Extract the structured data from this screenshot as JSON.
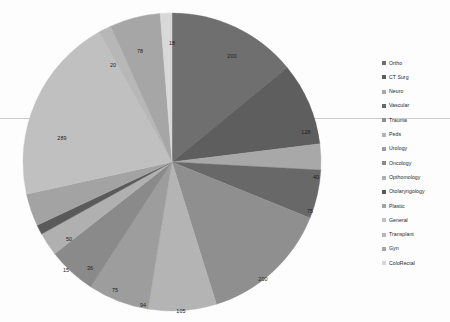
{
  "chart_data": {
    "type": "pie",
    "title": "",
    "xlabel": "",
    "ylabel": "",
    "legend_position": "right",
    "grid": false,
    "start_angle_deg": 0,
    "direction": "clockwise",
    "total": 1423,
    "categories": [
      "Ortho",
      "CT Surg",
      "Neuro",
      "Vascular",
      "Trauma",
      "Peds",
      "Urology",
      "Oncology",
      "Opthomology",
      "Otolaryngology",
      "Plastic",
      "General",
      "Transplant",
      "Gyn",
      "ColoRectal"
    ],
    "values": [
      200,
      128,
      40,
      75,
      200,
      105,
      94,
      75,
      36,
      15,
      50,
      289,
      20,
      78,
      18
    ],
    "data_labels": [
      "200",
      "128",
      "40",
      "75",
      "200",
      "105",
      "94",
      "75",
      "36",
      "15",
      "50",
      "289",
      "20",
      "78",
      "18"
    ],
    "colors": [
      "#6f6f6f",
      "#5e5e5e",
      "#a8a8a8",
      "#686868",
      "#8f8f8f",
      "#b4b4b4",
      "#9d9d9d",
      "#8a8a8a",
      "#b0b0b0",
      "#5a5a5a",
      "#a3a3a3",
      "#c0c0c0",
      "#b7b7b7",
      "#a6a6a6",
      "#d8d8d8"
    ],
    "label_positions": [
      {
        "label": "200",
        "x": 210,
        "y": 45
      },
      {
        "label": "128",
        "x": 284,
        "y": 121
      },
      {
        "label": "40",
        "x": 294,
        "y": 166
      },
      {
        "label": "75",
        "x": 288,
        "y": 200
      },
      {
        "label": "200",
        "x": 241,
        "y": 268
      },
      {
        "label": "105",
        "x": 159,
        "y": 300
      },
      {
        "label": "94",
        "x": 121,
        "y": 294
      },
      {
        "label": "75",
        "x": 93,
        "y": 279
      },
      {
        "label": "36",
        "x": 68,
        "y": 257
      },
      {
        "label": "15",
        "x": 44,
        "y": 259
      },
      {
        "label": "50",
        "x": 47,
        "y": 228
      },
      {
        "label": "289",
        "x": 40,
        "y": 127
      },
      {
        "label": "20",
        "x": 91,
        "y": 54
      },
      {
        "label": "78",
        "x": 118,
        "y": 40
      },
      {
        "label": "18",
        "x": 150,
        "y": 32
      }
    ]
  },
  "legend": {
    "items": [
      {
        "label": "Ortho",
        "color": "#6f6f6f"
      },
      {
        "label": "CT Surg",
        "color": "#5e5e5e"
      },
      {
        "label": "Neuro",
        "color": "#a8a8a8"
      },
      {
        "label": "Vascular",
        "color": "#686868"
      },
      {
        "label": "Trauma",
        "color": "#8f8f8f"
      },
      {
        "label": "Peds",
        "color": "#b4b4b4"
      },
      {
        "label": "Urology",
        "color": "#9d9d9d"
      },
      {
        "label": "Oncology",
        "color": "#8a8a8a"
      },
      {
        "label": "Opthomology",
        "color": "#b0b0b0"
      },
      {
        "label": "Otolaryngology",
        "color": "#5a5a5a"
      },
      {
        "label": "Plastic",
        "color": "#a3a3a3"
      },
      {
        "label": "General",
        "color": "#c0c0c0"
      },
      {
        "label": "Transplant",
        "color": "#b7b7b7"
      },
      {
        "label": "Gyn",
        "color": "#a6a6a6"
      },
      {
        "label": "ColoRectal",
        "color": "#d8d8d8"
      }
    ]
  }
}
